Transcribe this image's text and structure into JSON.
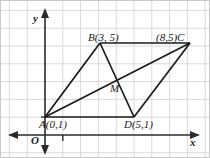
{
  "figure": {
    "type": "coordinate-geometry-diagram",
    "width": 210,
    "height": 158,
    "colors": {
      "grid": "#d8d8d8",
      "axis": "#2b2b2b",
      "shape": "#1a1a1a",
      "background": "#ffffff",
      "border": "#c8c8c8"
    }
  },
  "axes": {
    "x_label": "x",
    "y_label": "y",
    "origin_label": "O",
    "x_tick_label": "1",
    "y_tick_label": "1",
    "unit_px": 17.8,
    "origin_px": {
      "x": 45,
      "y": 135
    }
  },
  "points": [
    {
      "name": "A",
      "label": "A(0,1)",
      "coord_label": "(0,1)",
      "x": 0,
      "y": 1,
      "px": 45,
      "py": 117
    },
    {
      "name": "B",
      "label": "B(3, 5)",
      "coord_label": "(3, 5)",
      "x": 3,
      "y": 5,
      "px": 100,
      "py": 43
    },
    {
      "name": "C",
      "label": "(8,5)C",
      "coord_label": "(8,5)",
      "x": 8,
      "y": 5,
      "px": 190,
      "py": 43
    },
    {
      "name": "D",
      "label": "D(5,1)",
      "coord_label": "(5,1)",
      "x": 5,
      "y": 1,
      "px": 134,
      "py": 117
    },
    {
      "name": "M",
      "label": "M",
      "coord_label": "",
      "x": 4,
      "y": 3,
      "px": 117,
      "py": 80
    }
  ],
  "segments": [
    {
      "name": "AB",
      "from": "A",
      "to": "B"
    },
    {
      "name": "BC",
      "from": "B",
      "to": "C"
    },
    {
      "name": "CD",
      "from": "C",
      "to": "D"
    },
    {
      "name": "DA",
      "from": "D",
      "to": "A"
    },
    {
      "name": "AC",
      "from": "A",
      "to": "C"
    },
    {
      "name": "BD",
      "from": "B",
      "to": "D"
    }
  ],
  "labels": {
    "A": "A(0,1)",
    "B": "B(3, 5)",
    "C": "(8,5)C",
    "D": "D(5,1)",
    "M": "M",
    "x": "x",
    "y": "y",
    "O": "O",
    "one_x": "1",
    "one_y": "1"
  }
}
